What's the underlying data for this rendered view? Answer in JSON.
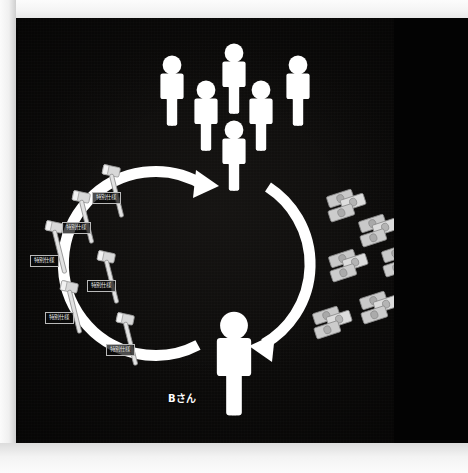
{
  "scene": {
    "title": "money-and-special-spec-cycle-diagram",
    "background_color": "#0d0c0b",
    "figure_color": "#ffffff",
    "frame_color": "#f4f4f4"
  },
  "labels": {
    "person_b": "Bさん",
    "special_spec": "特別仕様"
  },
  "crowd": {
    "name": "group-of-people",
    "count": 5,
    "members": [
      {
        "id": "crowd-person-1",
        "label": "特別仕様"
      },
      {
        "id": "crowd-person-2",
        "label": "特別仕様"
      },
      {
        "id": "crowd-person-3",
        "label": "特別仕様"
      },
      {
        "id": "crowd-person-4",
        "label": "特別仕様"
      },
      {
        "id": "crowd-person-5",
        "label": "特別仕様"
      }
    ]
  },
  "cycle": {
    "name": "circular-flow",
    "direction": "counterclockwise",
    "top_node": "buyer-person",
    "bottom_node": "Bさん",
    "arrow_count": 2
  },
  "gavels": {
    "name": "special-spec-items",
    "count": 6,
    "items": [
      {
        "label": "特別仕様"
      },
      {
        "label": "特別仕様"
      },
      {
        "label": "特別仕様"
      },
      {
        "label": "特別仕様"
      },
      {
        "label": "特別仕様"
      },
      {
        "label": "特別仕様"
      }
    ]
  },
  "money": {
    "name": "cash-bundles",
    "count": 6,
    "items": [
      {
        "id": "cash-1"
      },
      {
        "id": "cash-2"
      },
      {
        "id": "cash-3"
      },
      {
        "id": "cash-4"
      },
      {
        "id": "cash-5"
      },
      {
        "id": "cash-6"
      }
    ]
  }
}
